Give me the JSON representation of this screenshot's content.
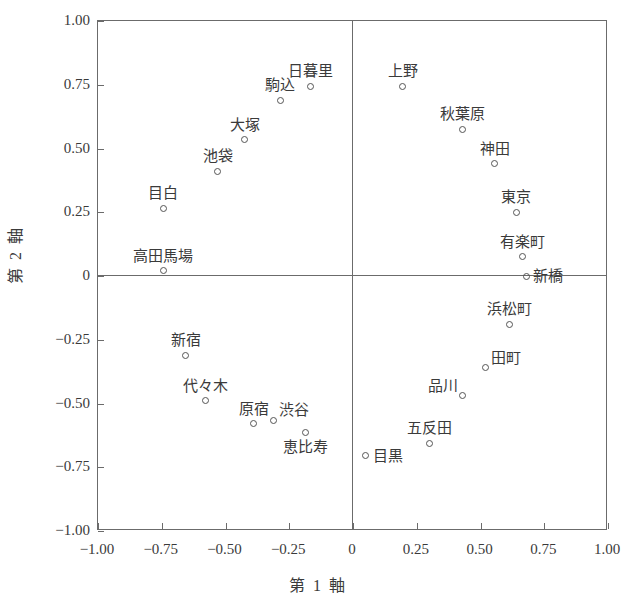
{
  "chart_data": {
    "type": "scatter",
    "title": "",
    "xlabel": "第 1 軸",
    "ylabel": "第 2 軸",
    "xlim": [
      -1.0,
      1.0
    ],
    "ylim": [
      -1.0,
      1.0
    ],
    "grid": false,
    "legend": "none",
    "xticks": [
      "-1.00",
      "-0.75",
      "-0.50",
      "-0.25",
      "0",
      "0.25",
      "0.50",
      "0.75",
      "1.00"
    ],
    "xtick_values": [
      -1.0,
      -0.75,
      -0.5,
      -0.25,
      0,
      0.25,
      0.5,
      0.75,
      1.0
    ],
    "yticks": [
      "1.00",
      "0.75",
      "0.50",
      "0.25",
      "0",
      "-0.25",
      "-0.50",
      "-0.75",
      "-1.00"
    ],
    "ytick_values": [
      1.0,
      0.75,
      0.5,
      0.25,
      0,
      -0.25,
      -0.5,
      -0.75,
      -1.0
    ],
    "marker": "open-circle",
    "marker_color": "#555555",
    "axis_color": "#6b6b6b",
    "points": [
      {
        "label": "日暮里",
        "x": -0.165,
        "y": 0.745,
        "pos": "above"
      },
      {
        "label": "駒込",
        "x": -0.285,
        "y": 0.69,
        "pos": "above"
      },
      {
        "label": "大塚",
        "x": -0.425,
        "y": 0.535,
        "pos": "above"
      },
      {
        "label": "池袋",
        "x": -0.53,
        "y": 0.41,
        "pos": "above"
      },
      {
        "label": "目白",
        "x": -0.745,
        "y": 0.265,
        "pos": "above"
      },
      {
        "label": "高田馬場",
        "x": -0.745,
        "y": 0.02,
        "pos": "above"
      },
      {
        "label": "上野",
        "x": 0.195,
        "y": 0.745,
        "pos": "above"
      },
      {
        "label": "秋葉原",
        "x": 0.43,
        "y": 0.575,
        "pos": "above"
      },
      {
        "label": "神田",
        "x": 0.555,
        "y": 0.44,
        "pos": "above"
      },
      {
        "label": "東京",
        "x": 0.64,
        "y": 0.25,
        "pos": "above"
      },
      {
        "label": "有楽町",
        "x": 0.665,
        "y": 0.075,
        "pos": "above"
      },
      {
        "label": "新橋",
        "x": 0.68,
        "y": 0.0,
        "pos": "right"
      },
      {
        "label": "新宿",
        "x": -0.655,
        "y": -0.31,
        "pos": "above"
      },
      {
        "label": "代々木",
        "x": -0.58,
        "y": -0.49,
        "pos": "above"
      },
      {
        "label": "原宿",
        "x": -0.39,
        "y": -0.58,
        "pos": "above"
      },
      {
        "label": "渋谷",
        "x": -0.31,
        "y": -0.565,
        "pos": "above-right"
      },
      {
        "label": "恵比寿",
        "x": -0.185,
        "y": -0.615,
        "pos": "below"
      },
      {
        "label": "浜松町",
        "x": 0.615,
        "y": -0.19,
        "pos": "above"
      },
      {
        "label": "田町",
        "x": 0.52,
        "y": -0.36,
        "pos": "above-right"
      },
      {
        "label": "品川",
        "x": 0.43,
        "y": -0.47,
        "pos": "above-left"
      },
      {
        "label": "五反田",
        "x": 0.3,
        "y": -0.655,
        "pos": "above"
      },
      {
        "label": "目黒",
        "x": 0.05,
        "y": -0.705,
        "pos": "right"
      }
    ]
  }
}
